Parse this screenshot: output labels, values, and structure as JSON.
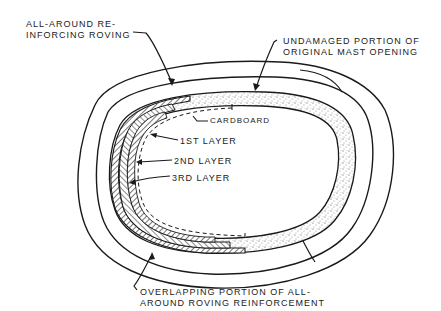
{
  "diagram": {
    "labels": {
      "reinforcing_roving": [
        "ALL-AROUND RE-",
        "INFORCING ROVING"
      ],
      "undamaged_portion": [
        "UNDAMAGED PORTION OF",
        "ORIGINAL MAST OPENING"
      ],
      "cardboard": "CARDBOARD",
      "layer1": "1ST LAYER",
      "layer2": "2ND LAYER",
      "layer3": "3RD LAYER",
      "overlapping_portion": [
        "OVERLAPPING PORTION OF ALL-",
        "AROUND ROVING REINFORCEMENT"
      ]
    },
    "colors": {
      "ink": "#1a1a1a",
      "paper": "#ffffff"
    }
  }
}
